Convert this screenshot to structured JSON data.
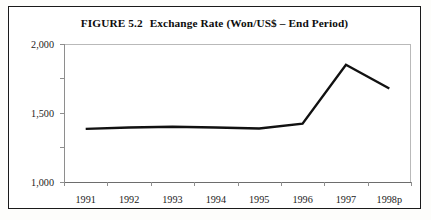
{
  "figure": {
    "number": "FIGURE 5.2",
    "title": "Exchange Rate (Won/US$ – End Period)"
  },
  "colors": {
    "line": "#111111",
    "axis": "#8e8e8e",
    "frame": "#1a1a1a",
    "text": "#1b1b1b",
    "background": "#ffffff"
  },
  "chart_data": {
    "type": "line",
    "xlabel": "",
    "ylabel": "",
    "categories": [
      "1991",
      "1992",
      "1993",
      "1994",
      "1995",
      "1996",
      "1997",
      "1998p"
    ],
    "values": [
      770,
      790,
      800,
      790,
      775,
      845,
      1700,
      1355
    ],
    "series": [
      {
        "name": "Exchange Rate (Won/US$ – End Period)",
        "values": [
          770,
          790,
          800,
          790,
          775,
          845,
          1700,
          1355
        ]
      }
    ],
    "ylim": [
      0,
      2000
    ],
    "ytick_values": [
      0,
      500,
      1000,
      1500,
      2000
    ],
    "ytick_labels": [
      "0%",
      "500",
      "1,000",
      "1,500",
      "2,000"
    ],
    "xtick_labels": [
      "1991",
      "1992",
      "1993",
      "1994",
      "1995",
      "1996",
      "1997",
      "1998p"
    ],
    "grid": false,
    "legend": null,
    "legend_position": "none",
    "annotations": []
  }
}
